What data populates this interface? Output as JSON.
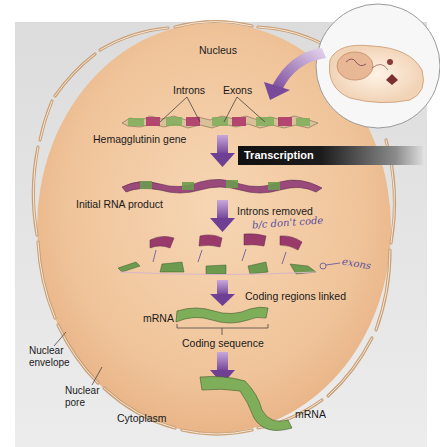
{
  "figure": {
    "labels": {
      "nucleus": "Nucleus",
      "introns": "Introns",
      "exons": "Exons",
      "gene": "Hemagglutinin gene",
      "transcription": "Transcription",
      "initial_rna": "Initial RNA product",
      "introns_removed": "Introns removed",
      "coding_linked": "Coding regions linked",
      "mrna_inside": "mRNA",
      "coding_sequence": "Coding sequence",
      "nuclear_envelope_1": "Nuclear",
      "nuclear_envelope_2": "envelope",
      "nuclear_pore_1": "Nuclear",
      "nuclear_pore_2": "pore",
      "cytoplasm": "Cytoplasm",
      "mrna_outside": "mRNA"
    },
    "handwritten": {
      "note_introns": "b/c don't code",
      "note_exons": "exons"
    },
    "colors": {
      "nucleus_fill": "#f2c9a0",
      "nucleus_edge": "#e8b88a",
      "background": "#e2e2e2",
      "intron": "#b03a6a",
      "exon": "#7fae5a",
      "arrow": "#8a5aa8",
      "mrna": "#6c9a4e",
      "banner": "#111111"
    }
  }
}
